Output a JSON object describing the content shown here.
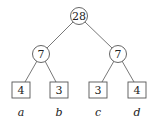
{
  "tree": {
    "root": {
      "value": "28",
      "cx": 79,
      "cy": 16
    },
    "internal": [
      {
        "value": "7",
        "cx": 41,
        "cy": 54
      },
      {
        "value": "7",
        "cx": 118,
        "cy": 54
      }
    ],
    "leaves": [
      {
        "value": "4",
        "label": "a",
        "cx": 21,
        "cy": 90
      },
      {
        "value": "3",
        "label": "b",
        "cx": 59,
        "cy": 90
      },
      {
        "value": "3",
        "label": "c",
        "cx": 98,
        "cy": 90
      },
      {
        "value": "4",
        "label": "d",
        "cx": 137,
        "cy": 90
      }
    ]
  },
  "colors": {
    "stroke": "#555555",
    "text": "#222222",
    "background": "#ffffff"
  }
}
